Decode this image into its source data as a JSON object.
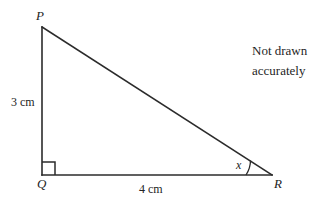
{
  "figure": {
    "type": "right-triangle-diagram",
    "note": {
      "line1": "Not drawn",
      "line2": "accurately"
    },
    "vertices": {
      "P": {
        "label": "P",
        "x": 42,
        "y": 27
      },
      "Q": {
        "label": "Q",
        "x": 42,
        "y": 175
      },
      "R": {
        "label": "R",
        "x": 272,
        "y": 175
      }
    },
    "sides": {
      "PQ": {
        "label": "3 cm",
        "value": 3,
        "unit": "cm"
      },
      "QR": {
        "label": "4 cm",
        "value": 4,
        "unit": "cm"
      },
      "PR": {
        "label": "",
        "value": null,
        "unit": ""
      }
    },
    "angles": {
      "Q": {
        "label": "",
        "marker": "right-angle-square",
        "value": 90
      },
      "R": {
        "label": "x",
        "marker": "arc",
        "value": null
      }
    },
    "stroke_color": "#2b2b2b",
    "text_color": "#242424",
    "background_color": "#ffffff"
  }
}
